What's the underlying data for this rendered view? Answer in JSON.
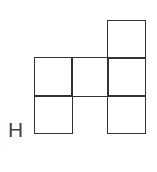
{
  "diagram": {
    "title": "",
    "type": "net-of-squares",
    "label": "H",
    "colors": {
      "stroke": "#333333",
      "label": "#444444",
      "background": "#ffffff"
    },
    "cells": [
      {
        "row": 0,
        "col": 2
      },
      {
        "row": 1,
        "col": 0
      },
      {
        "row": 1,
        "col": 1
      },
      {
        "row": 1,
        "col": 2
      },
      {
        "row": 2,
        "col": 0
      },
      {
        "row": 2,
        "col": 2
      }
    ]
  }
}
